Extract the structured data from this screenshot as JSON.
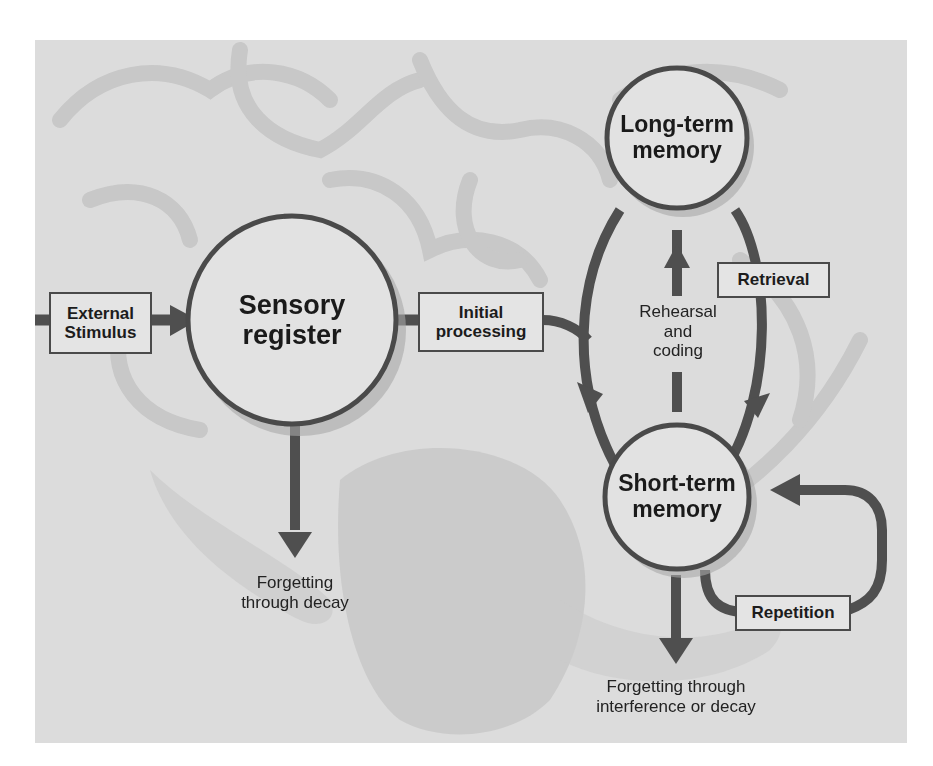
{
  "diagram": {
    "nodes": {
      "sensory_register": {
        "line1": "Sensory",
        "line2": "register"
      },
      "long_term_memory": {
        "line1": "Long-term",
        "line2": "memory"
      },
      "short_term_memory": {
        "line1": "Short-term",
        "line2": "memory"
      }
    },
    "boxes": {
      "external_stimulus": {
        "line1": "External",
        "line2": "Stimulus"
      },
      "initial_processing": {
        "line1": "Initial",
        "line2": "processing"
      },
      "retrieval": {
        "label": "Retrieval"
      },
      "repetition": {
        "label": "Repetition"
      }
    },
    "labels": {
      "rehearsal": {
        "line1": "Rehearsal",
        "line2": "and",
        "line3": "coding"
      },
      "forgetting_decay": {
        "line1": "Forgetting",
        "line2": "through decay"
      },
      "forgetting_interference": {
        "line1": "Forgetting through",
        "line2": "interference or decay"
      }
    },
    "colors": {
      "background_panel": "#dcdcdc",
      "brain_shading": "#c9c9c9",
      "node_fill": "#e2e2e2",
      "stroke": "#4d4d4d",
      "text": "#1a1a1a"
    }
  }
}
